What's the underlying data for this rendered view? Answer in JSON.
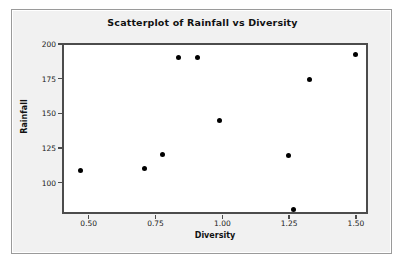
{
  "chart_data": {
    "type": "scatter",
    "title": "Scatterplot of Rainfall vs Diversity",
    "xlabel": "Diversity",
    "ylabel": "Rainfall",
    "xlim": [
      0.4,
      1.545
    ],
    "ylim": [
      77.4,
      200.7
    ],
    "xticks": [
      0.5,
      0.75,
      1.0,
      1.25,
      1.5
    ],
    "xtick_labels": [
      "0.50",
      "0.75",
      "1.00",
      "1.25",
      "1.50"
    ],
    "yticks": [
      100,
      125,
      150,
      175,
      200
    ],
    "ytick_labels": [
      "100",
      "125",
      "150",
      "175",
      "200"
    ],
    "grid": false,
    "legend": null,
    "marker": {
      "shape": "circle",
      "color": "#000000",
      "size": 5
    },
    "points": [
      {
        "x": 0.46,
        "y": 110
      },
      {
        "x": 0.7,
        "y": 112
      },
      {
        "x": 0.77,
        "y": 122
      },
      {
        "x": 0.83,
        "y": 192
      },
      {
        "x": 0.9,
        "y": 192
      },
      {
        "x": 0.98,
        "y": 146
      },
      {
        "x": 1.24,
        "y": 121
      },
      {
        "x": 1.26,
        "y": 82
      },
      {
        "x": 1.32,
        "y": 176
      },
      {
        "x": 1.49,
        "y": 194
      }
    ]
  },
  "colors": {
    "panel_background": "#f1f1f1",
    "plot_background": "#ffffff",
    "frame": "#4c4c4c",
    "marker": "#000000",
    "text": "#111111"
  }
}
